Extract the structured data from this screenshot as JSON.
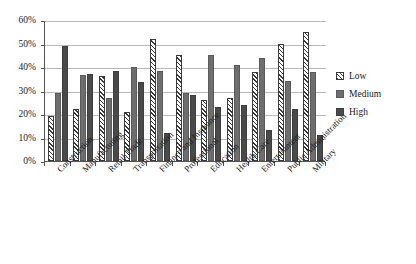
{
  "chart_data": {
    "type": "bar",
    "title": "",
    "subtitle": "",
    "xlabel": "",
    "ylabel": "",
    "ylim": [
      0,
      60
    ],
    "ytick_labels": [
      "0%",
      "10%",
      "20%",
      "30%",
      "40%",
      "50%",
      "60%"
    ],
    "ytick_values": [
      0,
      10,
      20,
      30,
      40,
      50,
      60
    ],
    "grid": true,
    "legend_position": "right",
    "value_unit": "percent",
    "categories": [
      "Construction",
      "Manufacturing",
      "Retail Trade",
      "Transportation",
      "Finance and Insurance",
      "Professional",
      "Education",
      "Health Care",
      "Entertainment",
      "Public Administration",
      "Military"
    ],
    "series": [
      {
        "name": "Low",
        "color": "#ffffff",
        "pattern": "diagonal-hatch",
        "values": [
          19,
          22,
          36,
          21,
          52,
          45,
          26,
          27,
          38,
          50,
          55
        ]
      },
      {
        "name": "Medium",
        "color": "#6e6e6e",
        "pattern": "solid",
        "values": [
          29,
          36.5,
          27,
          40,
          38.5,
          29,
          45,
          41,
          44,
          34,
          38
        ]
      },
      {
        "name": "High",
        "color": "#4a4a4a",
        "pattern": "solid",
        "values": [
          49,
          37,
          38.5,
          33.5,
          12,
          28,
          23,
          24,
          13,
          22,
          11
        ]
      }
    ]
  },
  "legend": {
    "items": [
      {
        "label": "Low"
      },
      {
        "label": "Medium"
      },
      {
        "label": "High"
      }
    ]
  },
  "colors": {
    "axis": "#555555",
    "gridline": "#b9b9b9",
    "background": "#ffffff",
    "low": "#ffffff",
    "medium": "#6e6e6e",
    "high": "#4a4a4a"
  }
}
